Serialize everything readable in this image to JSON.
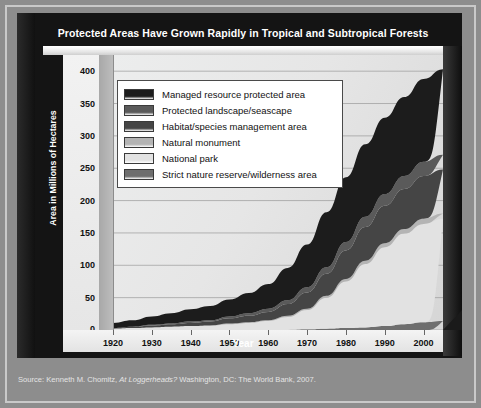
{
  "title": "Protected Areas Have Grown Rapidly in Tropical and Subtropical Forests",
  "axes": {
    "ylabel": "Area in Millions of Hectares",
    "xlabel": "Year"
  },
  "source": {
    "prefix": "Source: Kenneth M. Chomitz, ",
    "italic": "At Loggerheads?",
    "suffix": " Washington, DC: The World Bank, 2007."
  },
  "legend": {
    "items": [
      {
        "label": "Managed resource protected area",
        "color": "#1c1c1c"
      },
      {
        "label": "Protected landscape/seascape",
        "color": "#5a5a5a"
      },
      {
        "label": "Habitat/species management area",
        "color": "#454545"
      },
      {
        "label": "Natural monument",
        "color": "#b4b4b4"
      },
      {
        "label": "National park",
        "color": "#e2e2e2"
      },
      {
        "label": "Strict nature reserve/wilderness area",
        "color": "#6e6e6e"
      }
    ]
  },
  "chart_data": {
    "type": "area",
    "title": "Protected Areas Have Grown Rapidly in Tropical and Subtropical Forests",
    "xlabel": "Year",
    "ylabel": "Area in Millions of Hectares",
    "xlim": [
      1920,
      2005
    ],
    "ylim": [
      0,
      425
    ],
    "xticks": [
      1920,
      1930,
      1940,
      1950,
      1960,
      1970,
      1980,
      1990,
      2000
    ],
    "yticks": [
      0,
      50,
      100,
      150,
      200,
      250,
      300,
      350,
      400
    ],
    "grid": true,
    "legend_position": "upper-left-inside",
    "stacked": true,
    "x": [
      1920,
      1925,
      1930,
      1935,
      1940,
      1945,
      1950,
      1955,
      1960,
      1965,
      1970,
      1975,
      1980,
      1985,
      1990,
      1995,
      2000,
      2005
    ],
    "series": [
      {
        "name": "Strict nature reserve/wilderness area",
        "color": "#6e6e6e",
        "values": [
          0,
          0,
          0,
          0,
          0,
          0,
          0,
          0,
          0,
          0,
          1,
          2,
          3,
          4,
          6,
          9,
          12,
          14
        ]
      },
      {
        "name": "National park",
        "color": "#e2e2e2",
        "values": [
          2,
          3,
          4,
          5,
          6,
          7,
          9,
          11,
          14,
          20,
          30,
          48,
          72,
          98,
          122,
          140,
          152,
          158
        ]
      },
      {
        "name": "Natural monument",
        "color": "#b4b4b4",
        "values": [
          0,
          0,
          0,
          0,
          0,
          0,
          1,
          1,
          1,
          2,
          2,
          3,
          4,
          5,
          6,
          7,
          8,
          8
        ]
      },
      {
        "name": "Habitat/species management area",
        "color": "#454545",
        "values": [
          1,
          2,
          3,
          4,
          5,
          6,
          8,
          10,
          13,
          18,
          25,
          34,
          44,
          52,
          58,
          62,
          66,
          68
        ]
      },
      {
        "name": "Protected landscape/seascape",
        "color": "#5a5a5a",
        "values": [
          0,
          0,
          1,
          1,
          2,
          2,
          3,
          4,
          5,
          6,
          8,
          10,
          13,
          16,
          18,
          20,
          22,
          23
        ]
      },
      {
        "name": "Managed resource protected area",
        "color": "#1c1c1c",
        "values": [
          8,
          10,
          13,
          16,
          19,
          22,
          26,
          31,
          38,
          50,
          66,
          85,
          100,
          112,
          118,
          122,
          128,
          132
        ]
      }
    ],
    "totals": [
      11,
      15,
      21,
      26,
      32,
      37,
      47,
      57,
      71,
      96,
      132,
      182,
      236,
      287,
      328,
      360,
      388,
      403
    ]
  }
}
